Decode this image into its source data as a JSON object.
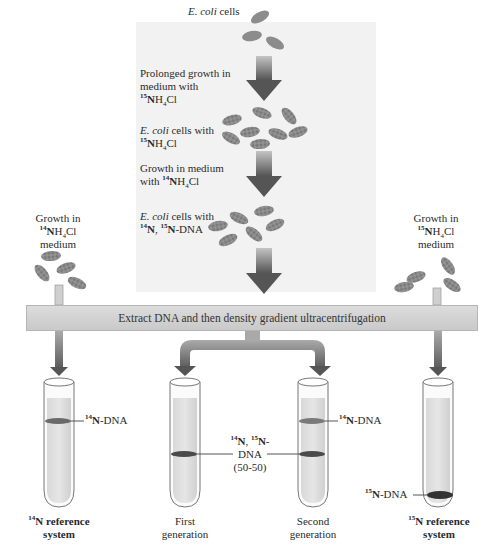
{
  "diagram": {
    "center_flow": {
      "step1_label": {
        "italic": "E. coli",
        "rest": " cells"
      },
      "arrow1_label": {
        "line1": "Prolonged growth in",
        "line2": "medium with",
        "isotope_sup": "15",
        "isotope_N": "N",
        "formula_rest": "H",
        "formula_sub": "4",
        "formula_end": "Cl"
      },
      "step2_label": {
        "italic": "E. coli",
        "rest": " cells with",
        "isotope_sup": "15",
        "isotope_N": "N",
        "formula_rest": "H",
        "formula_sub": "4",
        "formula_end": "Cl"
      },
      "arrow2_label": {
        "line1": "Growth in medium",
        "line2_prefix": "with ",
        "isotope_sup": "14",
        "isotope_N": "N",
        "formula_rest": "H",
        "formula_sub": "4",
        "formula_end": "Cl"
      },
      "step3_label": {
        "italic": "E. coli",
        "rest": " cells with",
        "iso1_sup": "14",
        "iso1_N": "N",
        "sep": ", ",
        "iso2_sup": "15",
        "iso2_N": "N",
        "suffix": "-DNA"
      }
    },
    "left_branch": {
      "line1": "Growth in",
      "isotope_sup": "14",
      "isotope_N": "N",
      "formula_rest": "H",
      "formula_sub": "4",
      "formula_end": "Cl",
      "line3": "medium"
    },
    "right_branch": {
      "line1": "Growth in",
      "isotope_sup": "15",
      "isotope_N": "N",
      "formula_rest": "H",
      "formula_sub": "4",
      "formula_end": "Cl",
      "line3": "medium"
    },
    "process_bar": "Extract DNA and then density gradient ultracentrifugation",
    "tubes": [
      {
        "id": "n14-reference",
        "caption_sup": "14",
        "caption_N": "N",
        "caption_rest": " reference",
        "caption_line2": "system",
        "bold": true
      },
      {
        "id": "first-generation",
        "caption_line1": "First",
        "caption_line2": "generation",
        "bold": false
      },
      {
        "id": "second-generation",
        "caption_line1": "Second",
        "caption_line2": "generation",
        "bold": false
      },
      {
        "id": "n15-reference",
        "caption_sup": "15",
        "caption_N": "N",
        "caption_rest": " reference",
        "caption_line2": "system",
        "bold": true
      }
    ],
    "band_labels": {
      "n14_dna": {
        "sup": "14",
        "N": "N",
        "rest": "-DNA"
      },
      "n15_dna": {
        "sup": "15",
        "N": "N",
        "rest": "-DNA"
      },
      "hybrid": {
        "sup1": "14",
        "N1": "N",
        "sep": ", ",
        "sup2": "15",
        "N2": "N",
        "dash": "-",
        "line2": "DNA",
        "line3": "(50-50)"
      }
    },
    "colors": {
      "panel": "#f2f2f2",
      "arrow_dark": "#555555",
      "arrow_light": "#b8b8b8",
      "bar": "#d2d2d2",
      "cell": "#8c8c8c",
      "band_dark": "#3d3d3d",
      "band_mid": "#6a6a6a"
    }
  }
}
